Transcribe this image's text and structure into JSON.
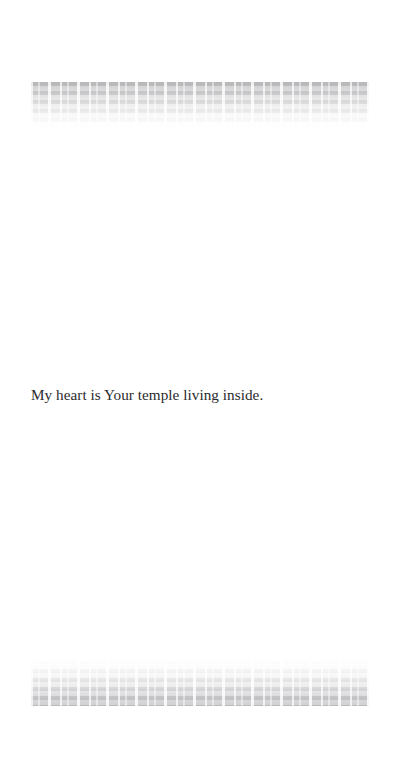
{
  "page": {
    "background_color": "#ffffff",
    "width": 400,
    "height": 765
  },
  "body": {
    "line": "My heart is Your temple living inside.",
    "text_color": "#2b2b2d"
  },
  "artifacts": {
    "top_bleed": {
      "label": "faded-bleedthrough-text-band",
      "description": "illegible faded grey text showing through from the reverse side of the page",
      "color": "#9b9b9e"
    },
    "bottom_bleed": {
      "label": "faded-bleedthrough-text-band",
      "description": "illegible faded grey text showing through from the reverse side of the page",
      "color": "#a6a6aa"
    }
  }
}
